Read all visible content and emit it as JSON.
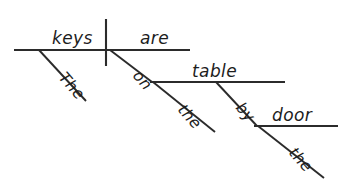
{
  "diagram": {
    "type": "reed-kellogg-sentence-diagram",
    "sentence": "The keys are on the table by the door.",
    "canvas": {
      "width": 340,
      "height": 185,
      "background": "#ffffff"
    },
    "ink_color": "#2b2b2b",
    "text_color": "#1d1d1d",
    "words": {
      "subject": "keys",
      "verb": "are",
      "subject_article": "The",
      "preposition_1": "on",
      "object_1": "table",
      "object_1_article": "the",
      "preposition_2": "by",
      "object_2": "door",
      "object_2_article": "the"
    },
    "labels": [
      {
        "id": "subject",
        "text": "keys",
        "x": 52,
        "y": 44,
        "rotate": 0,
        "role": "noun-subject"
      },
      {
        "id": "verb",
        "text": "are",
        "x": 140,
        "y": 44,
        "rotate": 0,
        "role": "verb-predicate"
      },
      {
        "id": "subject-article",
        "text": "The",
        "x": 58,
        "y": 78,
        "rotate": 49,
        "role": "article-modifier"
      },
      {
        "id": "preposition-on",
        "text": "on",
        "x": 132,
        "y": 76,
        "rotate": 49,
        "role": "preposition"
      },
      {
        "id": "object-table",
        "text": "table",
        "x": 192,
        "y": 77,
        "rotate": 0,
        "role": "object-of-preposition"
      },
      {
        "id": "article-the-table",
        "text": "the",
        "x": 177,
        "y": 110,
        "rotate": 49,
        "role": "article-modifier"
      },
      {
        "id": "preposition-by",
        "text": "by",
        "x": 235,
        "y": 108,
        "rotate": 49,
        "role": "preposition"
      },
      {
        "id": "object-door",
        "text": "door",
        "x": 272,
        "y": 121,
        "rotate": 0,
        "role": "object-of-preposition"
      },
      {
        "id": "article-the-door",
        "text": "the",
        "x": 288,
        "y": 153,
        "rotate": 49,
        "role": "article-modifier"
      }
    ],
    "lines": [
      {
        "id": "main-baseline",
        "x1": 14,
        "y1": 50,
        "x2": 190,
        "y2": 50,
        "role": "subject-verb-baseline"
      },
      {
        "id": "subject-verb-divider",
        "x1": 106,
        "y1": 19,
        "x2": 106,
        "y2": 66,
        "role": "vertical-divider"
      },
      {
        "id": "article-the-slant",
        "x1": 39,
        "y1": 50,
        "x2": 86,
        "y2": 101,
        "role": "modifier-slant"
      },
      {
        "id": "prep-on-slant",
        "x1": 110,
        "y1": 50,
        "x2": 152,
        "y2": 82,
        "role": "preposition-slant"
      },
      {
        "id": "table-baseline",
        "x1": 150,
        "y1": 82,
        "x2": 285,
        "y2": 82,
        "role": "prepositional-object-line"
      },
      {
        "id": "article-the2-slant",
        "x1": 153,
        "y1": 82,
        "x2": 215,
        "y2": 132,
        "role": "modifier-slant"
      },
      {
        "id": "prep-by-slant",
        "x1": 216,
        "y1": 82,
        "x2": 257,
        "y2": 126,
        "role": "preposition-slant"
      },
      {
        "id": "door-baseline",
        "x1": 254,
        "y1": 126,
        "x2": 338,
        "y2": 126,
        "role": "prepositional-object-line"
      },
      {
        "id": "article-the3-slant",
        "x1": 258,
        "y1": 126,
        "x2": 324,
        "y2": 178,
        "role": "modifier-slant"
      }
    ]
  }
}
